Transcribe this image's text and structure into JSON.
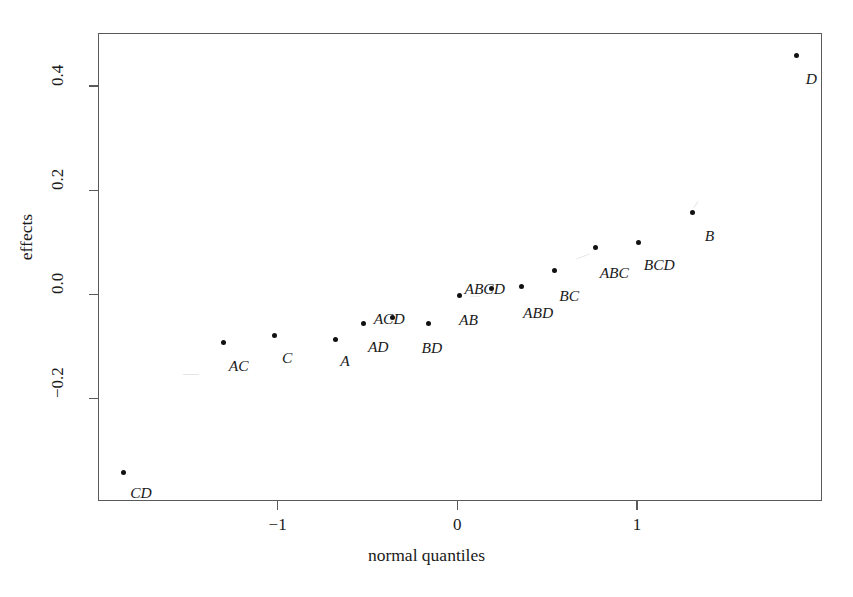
{
  "chart_data": {
    "type": "scatter",
    "title": "",
    "xlabel": "normal quantiles",
    "ylabel": "effects",
    "xlim": [
      -2.0,
      2.03
    ],
    "ylim": [
      -0.397,
      0.502
    ],
    "xticks": [
      -1,
      0,
      1
    ],
    "xticklabels": [
      "−1",
      "0",
      "1"
    ],
    "yticks": [
      -0.2,
      0.0,
      0.2,
      0.4
    ],
    "yticklabels": [
      "−0.2",
      "0.0",
      "0.2",
      "0.4"
    ],
    "grid": false,
    "legend": null,
    "point_label_style": "italic",
    "points": [
      {
        "label": "CD",
        "x": -1.86,
        "y": -0.342,
        "label_dx": 7,
        "label_dy": 13
      },
      {
        "label": "AC",
        "x": -1.3,
        "y": -0.093,
        "label_dx": 5,
        "label_dy": 15
      },
      {
        "label": "C",
        "x": -1.02,
        "y": -0.08,
        "label_dx": 8,
        "label_dy": 14
      },
      {
        "label": "A",
        "x": -0.68,
        "y": -0.086,
        "label_dx": 5,
        "label_dy": 14
      },
      {
        "label": "AD",
        "x": -0.52,
        "y": -0.056,
        "label_dx": 4,
        "label_dy": 16
      },
      {
        "label": "ACD",
        "x": -0.36,
        "y": -0.045,
        "label_dx": -19,
        "label_dy": -7
      },
      {
        "label": "BD",
        "x": -0.16,
        "y": -0.056,
        "label_dx": -7,
        "label_dy": 17
      },
      {
        "label": "AB",
        "x": 0.01,
        "y": -0.002,
        "label_dx": 0,
        "label_dy": 17
      },
      {
        "label": "ABCD",
        "x": 0.19,
        "y": 0.011,
        "label_dx": -27,
        "label_dy": -8
      },
      {
        "label": "ABD",
        "x": 0.36,
        "y": 0.015,
        "label_dx": 1,
        "label_dy": 18
      },
      {
        "label": "BC",
        "x": 0.54,
        "y": 0.045,
        "label_dx": 5,
        "label_dy": 17
      },
      {
        "label": "ABC",
        "x": 0.77,
        "y": 0.089,
        "label_dx": 4,
        "label_dy": 17
      },
      {
        "label": "BCD",
        "x": 1.01,
        "y": 0.099,
        "label_dx": 5,
        "label_dy": 14
      },
      {
        "label": "B",
        "x": 1.31,
        "y": 0.158,
        "label_dx": 12,
        "label_dy": 16
      },
      {
        "label": "D",
        "x": 1.89,
        "y": 0.459,
        "label_dx": 9,
        "label_dy": 16
      }
    ]
  },
  "colors": {
    "point": "#111111",
    "axis": "#5a5a5a",
    "text": "#1a1a1a",
    "background": "#ffffff"
  }
}
